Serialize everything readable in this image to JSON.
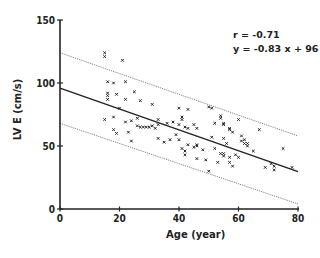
{
  "chart_data": {
    "type": "scatter",
    "title": "",
    "xlabel": "Age (year)",
    "ylabel": "LV E (cm/s)",
    "xlim": [
      0,
      80
    ],
    "ylim": [
      0,
      150
    ],
    "xticks": [
      0,
      20,
      40,
      60,
      80
    ],
    "yticks": [
      0,
      50,
      100,
      150
    ],
    "xtick_labels": [
      "0",
      "20",
      "40",
      "60",
      "80"
    ],
    "ytick_labels": [
      "0",
      "50",
      "100",
      "150"
    ],
    "grid": false,
    "legend": null,
    "annotations": [
      "r = -0.71",
      "y = -0.83 x + 96"
    ],
    "regression": {
      "slope": -0.83,
      "intercept": 96,
      "r": -0.71,
      "style": "solid"
    },
    "prediction_bands": [
      {
        "name": "upper",
        "x": [
          0,
          80
        ],
        "y": [
          124,
          58
        ],
        "style": "dotted"
      },
      {
        "name": "lower",
        "x": [
          0,
          80
        ],
        "y": [
          68,
          4
        ],
        "style": "dotted"
      }
    ],
    "series": [
      {
        "name": "subjects",
        "marker": "x",
        "points": [
          [
            15,
            124
          ],
          [
            15,
            121
          ],
          [
            21,
            118
          ],
          [
            16,
            101
          ],
          [
            18,
            100
          ],
          [
            22,
            101
          ],
          [
            16,
            92
          ],
          [
            16,
            90
          ],
          [
            19,
            91
          ],
          [
            25,
            93
          ],
          [
            27,
            86
          ],
          [
            16,
            87
          ],
          [
            22,
            87
          ],
          [
            20,
            80
          ],
          [
            15,
            71
          ],
          [
            18,
            73
          ],
          [
            22,
            69
          ],
          [
            24,
            70
          ],
          [
            26,
            72
          ],
          [
            26,
            66
          ],
          [
            27,
            65
          ],
          [
            28,
            65
          ],
          [
            30,
            65
          ],
          [
            18,
            63
          ],
          [
            19,
            60
          ],
          [
            23,
            61
          ],
          [
            24,
            54
          ],
          [
            31,
            83
          ],
          [
            40,
            80
          ],
          [
            43,
            79
          ],
          [
            41,
            73
          ],
          [
            41,
            71
          ],
          [
            33,
            71
          ],
          [
            33,
            67
          ],
          [
            31,
            66
          ],
          [
            32,
            64
          ],
          [
            29,
            65
          ],
          [
            36,
            68
          ],
          [
            38,
            69
          ],
          [
            40,
            67
          ],
          [
            42,
            65
          ],
          [
            45,
            67
          ],
          [
            46,
            64
          ],
          [
            43,
            64
          ],
          [
            33,
            56
          ],
          [
            35,
            53
          ],
          [
            37,
            55
          ],
          [
            39,
            59
          ],
          [
            40,
            55
          ],
          [
            41,
            48
          ],
          [
            42,
            43
          ],
          [
            42,
            46
          ],
          [
            43,
            51
          ],
          [
            45,
            49
          ],
          [
            46,
            50
          ],
          [
            50,
            81
          ],
          [
            51,
            80
          ],
          [
            54,
            72
          ],
          [
            54,
            74
          ],
          [
            52,
            68
          ],
          [
            55,
            67
          ],
          [
            55,
            68
          ],
          [
            57,
            63
          ],
          [
            57,
            64
          ],
          [
            60,
            71
          ],
          [
            58,
            61
          ],
          [
            51,
            57
          ],
          [
            55,
            56
          ],
          [
            56,
            52
          ],
          [
            61,
            54
          ],
          [
            62,
            52
          ],
          [
            63,
            50
          ],
          [
            46,
            51
          ],
          [
            48,
            47
          ],
          [
            52,
            48
          ],
          [
            54,
            44
          ],
          [
            55,
            42
          ],
          [
            55,
            44
          ],
          [
            57,
            41
          ],
          [
            59,
            43
          ],
          [
            60,
            41
          ],
          [
            49,
            39
          ],
          [
            53,
            37
          ],
          [
            57,
            37
          ],
          [
            58,
            34
          ],
          [
            46,
            40
          ],
          [
            67,
            63
          ],
          [
            61,
            58
          ],
          [
            62,
            55
          ],
          [
            63,
            52
          ],
          [
            65,
            46
          ],
          [
            75,
            48
          ],
          [
            69,
            33
          ],
          [
            71,
            36
          ],
          [
            72,
            34
          ],
          [
            72,
            31
          ],
          [
            78,
            33
          ],
          [
            50,
            30
          ]
        ]
      }
    ]
  },
  "colors": {
    "ink": "#222222",
    "band": "#555555",
    "background": "#ffffff"
  }
}
